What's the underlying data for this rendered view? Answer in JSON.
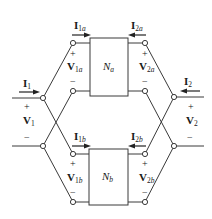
{
  "diagram": {
    "networks": [
      {
        "id": "Na",
        "label_main": "N",
        "label_sub": "a"
      },
      {
        "id": "Nb",
        "label_main": "N",
        "label_sub": "b"
      }
    ],
    "currents": {
      "I1": {
        "main": "I",
        "sub": "1"
      },
      "I2": {
        "main": "I",
        "sub": "2"
      },
      "I1a": {
        "main": "I",
        "sub1": "1",
        "sub2": "a"
      },
      "I2a": {
        "main": "I",
        "sub1": "2",
        "sub2": "a"
      },
      "I1b": {
        "main": "I",
        "sub1": "1",
        "sub2": "b"
      },
      "I2b": {
        "main": "I",
        "sub1": "2",
        "sub2": "b"
      }
    },
    "voltages": {
      "V1": {
        "main": "V",
        "sub": "1"
      },
      "V2": {
        "main": "V",
        "sub": "2"
      },
      "V1a": {
        "main": "V",
        "sub1": "1",
        "sub2": "a"
      },
      "V2a": {
        "main": "V",
        "sub1": "2",
        "sub2": "a"
      },
      "V1b": {
        "main": "V",
        "sub1": "1",
        "sub2": "b"
      },
      "V2b": {
        "main": "V",
        "sub1": "2",
        "sub2": "b"
      }
    },
    "signs": {
      "plus": "+",
      "minus": "−"
    },
    "colors": {
      "line": "#3a3a3a",
      "text": "#1a1a1a"
    }
  }
}
